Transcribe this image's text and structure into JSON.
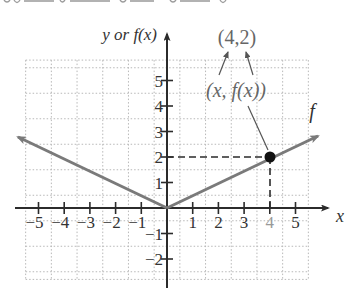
{
  "chart_data": {
    "type": "line",
    "title": "",
    "function_name": "f",
    "xlabel": "x",
    "ylabel": "y or f(x)",
    "xlim": [
      -5.5,
      5.5
    ],
    "ylim": [
      -2.8,
      5.8
    ],
    "grid": true,
    "x_ticks": [
      -5,
      -4,
      -3,
      -2,
      -1,
      1,
      2,
      3,
      4,
      5
    ],
    "x_tick_labels": [
      "−5",
      "−4",
      "−3",
      "−2",
      "−1",
      "1",
      "2",
      "3",
      "4",
      "5"
    ],
    "y_ticks": [
      -2,
      -1,
      1,
      2,
      3,
      4,
      5
    ],
    "y_tick_labels": [
      "−2",
      "−1",
      "1",
      "2",
      "3",
      "4",
      "5"
    ],
    "series": [
      {
        "name": "f",
        "x": [
          -5.5,
          0,
          5.5
        ],
        "y": [
          2.75,
          0,
          2.75
        ],
        "color": "#7a7a7a",
        "arrows": "both"
      }
    ],
    "highlight_point": {
      "x": 4,
      "y": 2,
      "color": "#111111"
    },
    "annotations": [
      {
        "text": "(4,2)",
        "position": "above"
      },
      {
        "text": "(x, f(x))",
        "position": "below (4,2)"
      },
      {
        "text": "f",
        "position": "near right arrow"
      }
    ]
  },
  "labels": {
    "y_axis": "y or f(x)",
    "x_axis": "x",
    "point_label": "(4,2)",
    "generic_label": "(x, f(x))",
    "function_label": "f",
    "tick_x": [
      "−5",
      "−4",
      "−3",
      "−2",
      "−1",
      "1",
      "2",
      "3",
      "4",
      "5"
    ],
    "tick_y": [
      "5",
      "4",
      "3",
      "2",
      "1",
      "−1",
      "−2"
    ]
  },
  "colors": {
    "axis": "#2b2b2b",
    "grid": "#b8b8b8",
    "curve": "#7a7a7a",
    "point": "#111111",
    "annotation_text": "#666666",
    "tick_text": "#333333"
  }
}
